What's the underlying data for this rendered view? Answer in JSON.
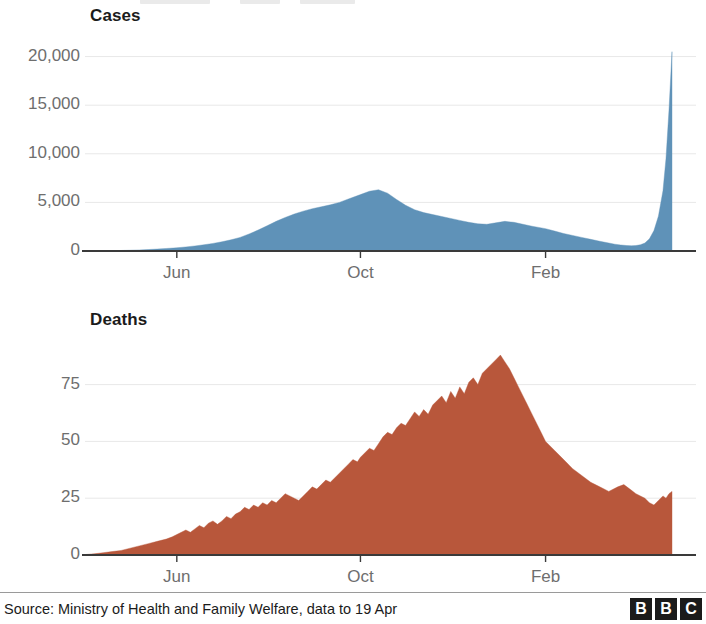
{
  "footer": {
    "source": "Source: Ministry of Health and Family Welfare, data to 19 Apr",
    "logo": [
      "B",
      "B",
      "C"
    ]
  },
  "colors": {
    "cases_fill": "#5f92b8",
    "deaths_fill": "#b8573b",
    "axis": "#3a3a3a",
    "grid": "#e8e8e8",
    "tick_text": "#6e6e6e",
    "title_text": "#1b1b1b"
  },
  "chart_data": [
    {
      "id": "cases",
      "type": "area",
      "title": "Cases",
      "xlabel": "",
      "ylabel": "",
      "ylim": [
        0,
        21500
      ],
      "yticks": [
        0,
        5000,
        10000,
        15000,
        20000
      ],
      "ytick_labels": [
        "0",
        "5,000",
        "10,000",
        "15,000",
        "20,000"
      ],
      "xticks": [
        61,
        183,
        306
      ],
      "xtick_labels": [
        "Jun",
        "Oct",
        "Feb"
      ],
      "xlim": [
        0,
        390
      ],
      "grid": true,
      "legend": "none",
      "x": [
        0,
        6,
        12,
        18,
        24,
        30,
        36,
        42,
        48,
        54,
        61,
        67,
        73,
        79,
        85,
        91,
        97,
        103,
        109,
        115,
        121,
        127,
        133,
        139,
        145,
        151,
        157,
        163,
        169,
        175,
        183,
        189,
        195,
        201,
        207,
        213,
        219,
        225,
        231,
        237,
        243,
        249,
        255,
        261,
        267,
        273,
        279,
        285,
        291,
        297,
        306,
        312,
        318,
        324,
        330,
        336,
        342,
        348,
        352,
        356,
        360,
        363,
        366,
        369,
        372,
        375,
        378,
        381,
        384,
        386,
        388,
        390
      ],
      "values": [
        5,
        10,
        20,
        35,
        55,
        80,
        110,
        150,
        200,
        260,
        330,
        420,
        520,
        640,
        780,
        950,
        1150,
        1400,
        1750,
        2150,
        2600,
        3050,
        3450,
        3800,
        4100,
        4350,
        4550,
        4750,
        5000,
        5350,
        5800,
        6150,
        6300,
        5950,
        5300,
        4700,
        4250,
        3950,
        3750,
        3550,
        3350,
        3150,
        2950,
        2800,
        2750,
        2900,
        3050,
        2950,
        2750,
        2550,
        2300,
        2050,
        1800,
        1600,
        1400,
        1200,
        1000,
        820,
        700,
        620,
        560,
        540,
        560,
        640,
        820,
        1250,
        2100,
        3600,
        6200,
        9500,
        14500,
        20500
      ]
    },
    {
      "id": "deaths",
      "type": "area",
      "title": "Deaths",
      "xlabel": "",
      "ylabel": "",
      "ylim": [
        0,
        92
      ],
      "yticks": [
        0,
        25,
        50,
        75
      ],
      "ytick_labels": [
        "0",
        "25",
        "50",
        "75"
      ],
      "xticks": [
        61,
        183,
        306
      ],
      "xtick_labels": [
        "Jun",
        "Oct",
        "Feb"
      ],
      "xlim": [
        0,
        390
      ],
      "grid": true,
      "legend": "none",
      "x": [
        0,
        6,
        12,
        18,
        24,
        30,
        36,
        42,
        48,
        54,
        58,
        61,
        64,
        67,
        70,
        73,
        76,
        79,
        82,
        85,
        88,
        91,
        94,
        97,
        100,
        103,
        106,
        109,
        112,
        115,
        118,
        121,
        124,
        127,
        130,
        133,
        136,
        139,
        142,
        145,
        148,
        151,
        154,
        157,
        160,
        163,
        166,
        169,
        172,
        175,
        178,
        181,
        183,
        186,
        189,
        192,
        195,
        198,
        201,
        204,
        207,
        210,
        213,
        216,
        219,
        222,
        225,
        228,
        231,
        234,
        237,
        240,
        243,
        246,
        249,
        252,
        255,
        258,
        261,
        264,
        267,
        270,
        273,
        276,
        279,
        282,
        285,
        288,
        291,
        294,
        297,
        300,
        303,
        306,
        312,
        318,
        324,
        330,
        336,
        342,
        348,
        354,
        358,
        362,
        366,
        369,
        372,
        375,
        378,
        381,
        384,
        386,
        388,
        390
      ],
      "values": [
        0.2,
        0.5,
        1,
        1.5,
        2,
        3,
        4,
        5,
        6,
        7,
        8,
        9,
        10,
        11,
        10,
        11.5,
        13,
        12,
        14,
        15,
        13.5,
        15,
        17,
        16,
        18,
        19,
        21,
        20,
        22,
        21,
        23,
        22,
        24,
        23,
        25,
        27,
        26,
        25,
        24,
        26,
        28,
        30,
        29,
        31,
        33,
        32,
        34,
        36,
        38,
        40,
        42,
        41,
        43,
        45,
        47,
        46,
        49,
        52,
        54,
        53,
        56,
        58,
        57,
        60,
        63,
        61,
        64,
        62,
        66,
        68,
        70,
        67,
        72,
        69,
        74,
        71,
        76,
        78,
        75,
        80,
        82,
        84,
        86,
        88,
        85,
        82,
        78,
        74,
        70,
        66,
        62,
        58,
        54,
        50,
        46,
        42,
        38,
        35,
        32,
        30,
        28,
        30,
        31,
        29,
        27,
        26,
        25,
        23,
        22,
        24,
        26,
        25,
        27,
        28,
        30,
        31,
        29,
        27,
        26,
        24,
        22,
        20,
        18,
        17,
        15,
        14,
        13,
        12,
        11,
        10,
        9,
        8,
        7,
        6.5,
        6,
        5.5,
        5,
        4.5,
        4,
        4,
        4.5,
        5,
        6,
        8,
        12,
        20,
        34,
        52,
        72,
        88
      ]
    }
  ]
}
